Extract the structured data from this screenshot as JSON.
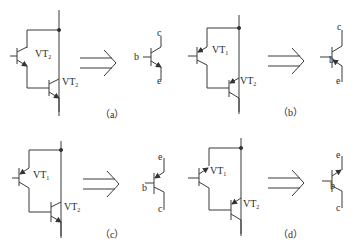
{
  "panels": [
    {
      "id": "a",
      "caption": "（a）",
      "upper_transistor": {
        "name": "VT",
        "sub": "2",
        "type": "NPN"
      },
      "lower_transistor": {
        "name": "VT",
        "sub": "2",
        "type": "NPN"
      },
      "equivalent": {
        "type": "NPN",
        "terminals": {
          "top": "c",
          "base": "b",
          "bottom": "e"
        }
      }
    },
    {
      "id": "b",
      "caption": "（b）",
      "upper_transistor": {
        "name": "VT",
        "sub": "1",
        "type": "PNP"
      },
      "lower_transistor": {
        "name": "VT",
        "sub": "2",
        "type": "PNP"
      },
      "equivalent": {
        "type": "PNP",
        "terminals": {
          "top": "c",
          "base": "b",
          "bottom": "e"
        }
      }
    },
    {
      "id": "c",
      "caption": "（c）",
      "upper_transistor": {
        "name": "VT",
        "sub": "1",
        "type": "PNP"
      },
      "lower_transistor": {
        "name": "VT",
        "sub": "2",
        "type": "NPN"
      },
      "equivalent": {
        "type": "PNP",
        "terminals": {
          "top": "e",
          "base": "b",
          "bottom": "c"
        }
      }
    },
    {
      "id": "d",
      "caption": "（d）",
      "upper_transistor": {
        "name": "VT",
        "sub": "1",
        "type": "NPN"
      },
      "lower_transistor": {
        "name": "VT",
        "sub": "2",
        "type": "PNP"
      },
      "equivalent": {
        "type": "NPN",
        "terminals": {
          "top": "e",
          "base": "b",
          "bottom": "c"
        }
      }
    }
  ],
  "arrow_symbol": "double-arrow-implies",
  "colors": {
    "line": "#3a3a3a",
    "background": "#ffffff"
  }
}
